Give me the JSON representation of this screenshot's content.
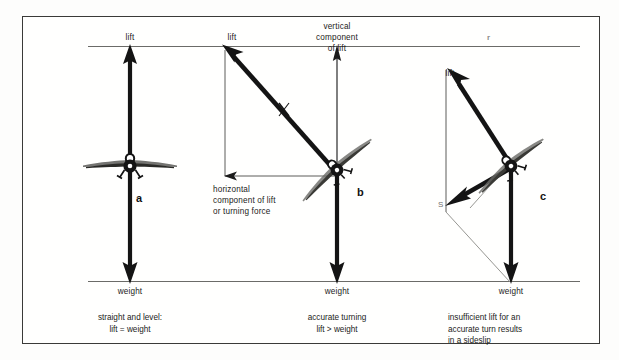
{
  "figure": {
    "title_visible": false,
    "background_color": "#fdfdfc",
    "frame_color": "#3a3a38",
    "vector_color": "#141414",
    "thin_line_color": "#6b6b68",
    "aircraft_color": "#1a1a1a"
  },
  "panels": [
    {
      "id": "a",
      "letter": "a",
      "labels": {
        "lift": "lift",
        "weight": "weight"
      },
      "caption_lines": [
        "straight and level:",
        "lift = weight"
      ]
    },
    {
      "id": "b",
      "letter": "b",
      "labels": {
        "lift": "lift",
        "weight": "weight",
        "vertical_component": "vertical\ncomponent\nof lift",
        "vertical_component_lines": [
          "vertical",
          "component",
          "of lift"
        ],
        "horizontal_component_lines": [
          "horizontal",
          "component of lift",
          "or turning force"
        ]
      },
      "caption_lines": [
        "accurate turning",
        "lift > weight"
      ]
    },
    {
      "id": "c",
      "letter": "c",
      "labels": {
        "lift": "lift",
        "weight": "weight",
        "sideslip_mark": "S",
        "faint_mark": "r"
      },
      "caption_lines": [
        "insufficient lift for an",
        "accurate turn results",
        "in a sideslip"
      ]
    }
  ],
  "reference_lines": {
    "top_label": "lift level reference",
    "bottom_label": "weight level reference"
  }
}
